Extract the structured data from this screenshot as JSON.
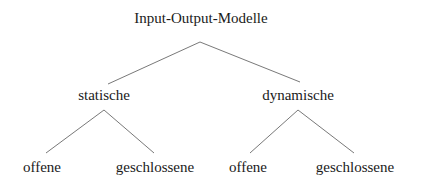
{
  "diagram": {
    "type": "tree",
    "root": {
      "label": "Input-Output-Modelle",
      "children": [
        {
          "label": "statische",
          "children": [
            {
              "label": "offene"
            },
            {
              "label": "geschlossene"
            }
          ]
        },
        {
          "label": "dynamische",
          "children": [
            {
              "label": "offene"
            },
            {
              "label": "geschlossene"
            }
          ]
        }
      ]
    },
    "edge_color": "#555555"
  }
}
